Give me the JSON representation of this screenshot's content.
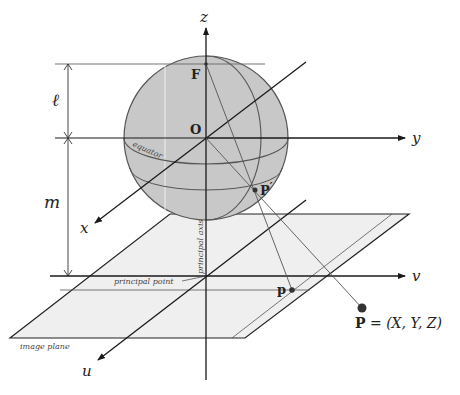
{
  "diagram": {
    "type": "spherical-camera-projection",
    "axes": {
      "z": {
        "label": "z"
      },
      "y": {
        "label": "y"
      },
      "x": {
        "label": "x"
      },
      "v": {
        "label": "v"
      },
      "u": {
        "label": "u"
      }
    },
    "points": {
      "focal": {
        "label": "F"
      },
      "origin": {
        "label": "O"
      },
      "sphere_point": {
        "label": "P",
        "prime": "′"
      },
      "image_point": {
        "label": "p"
      },
      "world_point": {
        "label": "P",
        "equation": " = (X, Y, Z)"
      }
    },
    "dimensions": {
      "l": {
        "label": "ℓ"
      },
      "m": {
        "label": "m"
      }
    },
    "annotations": {
      "equator": "equator",
      "principal_axis": "principal axis",
      "principal_point": "principal point",
      "image_plane": "image plane"
    },
    "colors": {
      "sphere_fill": "#c8c8c8",
      "sphere_stroke": "#555555",
      "plane_fill": "#efefef",
      "axis": "#1a1a1a",
      "ray": "#555555",
      "point": "#333333"
    }
  }
}
